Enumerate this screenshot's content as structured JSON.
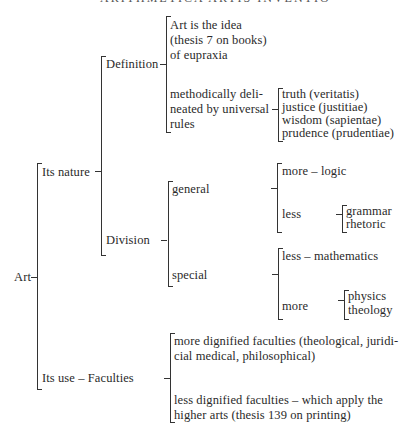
{
  "running_head": "ARITHMETICA ARTIS INVENTIO",
  "root": "Art",
  "level1": {
    "nature": "Its nature",
    "use": "Its use – Faculties"
  },
  "nature": {
    "definition": "Definition",
    "division": "Division"
  },
  "definition": {
    "idea": [
      "Art is the idea",
      "(thesis 7 on books)",
      "of eupraxia"
    ],
    "method": [
      "methodically deli-",
      "neated by universal",
      "rules"
    ],
    "virtues": [
      "truth (veritatis)",
      "justice (justitiae)",
      "wisdom (sapientae)",
      "prudence (prudentiae)"
    ]
  },
  "division": {
    "general": "general",
    "special": "special",
    "general_more": "more – logic",
    "general_less": "less",
    "general_less_items": [
      "grammar",
      "rhetoric"
    ],
    "special_less": "less – mathematics",
    "special_more": "more",
    "special_more_items": [
      "physics",
      "theology"
    ]
  },
  "faculties": {
    "more": [
      "more dignified faculties (theological, juridi-",
      "cial medical, philosophical)"
    ],
    "less": [
      "less dignified faculties – which apply the",
      "higher arts (thesis 139 on printing)"
    ]
  }
}
